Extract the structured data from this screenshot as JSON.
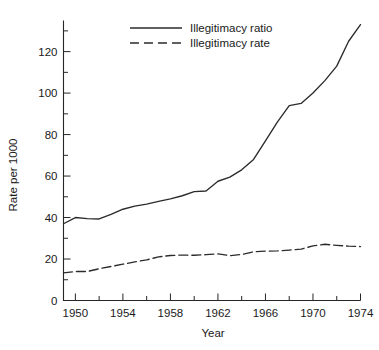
{
  "chart_data": {
    "type": "line",
    "title": "",
    "xlabel": "Year",
    "ylabel": "Rate per 1000",
    "xlim": [
      1949,
      1974
    ],
    "ylim": [
      0,
      135
    ],
    "grid": false,
    "legend_position": "top-center",
    "x_ticks_major": [
      1950,
      1954,
      1958,
      1962,
      1966,
      1970,
      1974
    ],
    "x_ticks_minor": [
      1952,
      1956,
      1960,
      1964,
      1968,
      1972
    ],
    "y_ticks_major": [
      0,
      20,
      40,
      60,
      80,
      100,
      120
    ],
    "y_ticks_minor": [
      10,
      30,
      50,
      70,
      90,
      110,
      130
    ],
    "x": [
      1949,
      1950,
      1951,
      1952,
      1953,
      1954,
      1955,
      1956,
      1957,
      1958,
      1959,
      1960,
      1961,
      1962,
      1963,
      1964,
      1965,
      1966,
      1967,
      1968,
      1969,
      1970,
      1971,
      1972,
      1973,
      1974
    ],
    "series": [
      {
        "name": "Illegitimacy ratio",
        "style": "solid",
        "values": [
          37.0,
          40.0,
          39.5,
          39.3,
          41.5,
          44.0,
          45.5,
          46.5,
          47.8,
          49.0,
          50.5,
          52.5,
          52.8,
          57.5,
          59.5,
          63.0,
          68.0,
          77.0,
          86.0,
          94.0,
          95.0,
          100.0,
          106.0,
          113.0,
          125.0,
          133.0
        ]
      },
      {
        "name": "Illegitimacy rate",
        "style": "dashed",
        "values": [
          13.3,
          14.0,
          14.0,
          15.3,
          16.4,
          17.5,
          18.6,
          19.6,
          21.0,
          21.7,
          21.9,
          21.8,
          22.1,
          22.5,
          21.6,
          22.2,
          23.5,
          23.8,
          23.9,
          24.3,
          24.8,
          26.3,
          27.1,
          26.6,
          26.2,
          26.0
        ]
      }
    ],
    "annotations": []
  },
  "legend": {
    "entries": [
      {
        "label": "Illegitimacy ratio",
        "style": "solid"
      },
      {
        "label": "Illegitimacy rate",
        "style": "dashed"
      }
    ]
  },
  "colors": {
    "ink": "#1a1a1a",
    "line": "#2b2b2b",
    "axis": "#262626",
    "background": "#ffffff"
  }
}
